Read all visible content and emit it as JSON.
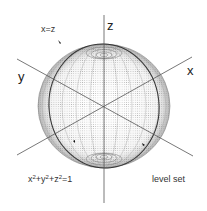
{
  "figure": {
    "axes": {
      "x_label": "x",
      "y_label": "y",
      "z_label": "z"
    },
    "annotations": {
      "plane_label": "x=z",
      "equation_parts": [
        "x",
        "2",
        "+y",
        "2",
        "+z",
        "2",
        "=1"
      ],
      "caption": "level set"
    },
    "geometry": {
      "sphere_center": [
        104,
        106
      ],
      "sphere_radius": 66,
      "colors": {
        "line": "#555555",
        "dots": "#777777",
        "great_circle": "#333333",
        "marker": "#111111"
      }
    }
  }
}
